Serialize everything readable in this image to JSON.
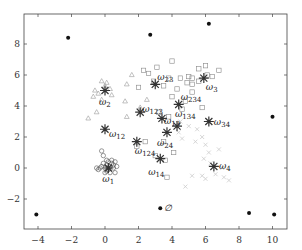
{
  "chart_data": {
    "type": "scatter",
    "title": "",
    "xlabel": "",
    "ylabel": "",
    "xlim": [
      -4.8,
      11
    ],
    "ylim": [
      -3.9,
      9.9
    ],
    "grid": false,
    "legend": null,
    "x_ticks": [
      -4,
      -2,
      0,
      2,
      4,
      6,
      8,
      10
    ],
    "y_ticks": [
      -2,
      0,
      2,
      4,
      6,
      8
    ],
    "x_tick_labels": [
      "-4",
      "-2",
      "0",
      "2",
      "4",
      "6",
      "8",
      "10"
    ],
    "y_tick_labels": [
      "-2",
      "0",
      "2",
      "4",
      "6",
      "8"
    ],
    "series": [
      {
        "name": "outliers",
        "marker": "filled-dot",
        "color": "#111111",
        "points": [
          [
            -4.1,
            -3.0
          ],
          [
            -2.2,
            8.4
          ],
          [
            2.7,
            8.6
          ],
          [
            6.2,
            9.3
          ],
          [
            10.0,
            3.3
          ],
          [
            3.3,
            -2.6
          ],
          [
            8.6,
            -2.9
          ],
          [
            10.1,
            -3.0
          ]
        ]
      },
      {
        "name": "cluster-1-circles",
        "marker": "circle",
        "color": "#555555",
        "points": [
          [
            -0.3,
            0.0
          ],
          [
            -0.5,
            0.0
          ],
          [
            -0.2,
            0.1
          ],
          [
            0.0,
            0.0
          ],
          [
            0.1,
            0.2
          ],
          [
            0.2,
            0.0
          ],
          [
            0.3,
            0.1
          ],
          [
            0.4,
            0.3
          ],
          [
            0.5,
            0.0
          ],
          [
            0.6,
            0.4
          ],
          [
            -0.1,
            0.3
          ],
          [
            0.1,
            -0.2
          ],
          [
            0.2,
            0.4
          ],
          [
            0.3,
            -0.3
          ],
          [
            0.6,
            -0.3
          ],
          [
            0.7,
            0.1
          ],
          [
            -0.2,
            1.1
          ],
          [
            -0.1,
            0.8
          ],
          [
            0.4,
            0.5
          ],
          [
            0.2,
            -0.1
          ],
          [
            0.0,
            -0.3
          ],
          [
            -0.4,
            -0.1
          ],
          [
            0.5,
            0.2
          ],
          [
            0.1,
            0.5
          ]
        ]
      },
      {
        "name": "cluster-2-triangles",
        "marker": "triangle",
        "color": "#999999",
        "points": [
          [
            -0.6,
            5.0
          ],
          [
            -0.4,
            4.8
          ],
          [
            0.0,
            5.3
          ],
          [
            0.3,
            5.1
          ],
          [
            -0.2,
            4.4
          ],
          [
            1.3,
            5.4
          ],
          [
            1.6,
            6.0
          ],
          [
            1.2,
            4.3
          ],
          [
            -0.5,
            3.6
          ],
          [
            -1.0,
            3.2
          ],
          [
            1.3,
            3.3
          ],
          [
            -0.2,
            5.6
          ],
          [
            0.4,
            4.7
          ],
          [
            -0.7,
            4.6
          ],
          [
            2.5,
            4.4
          ],
          [
            2.1,
            3.9
          ],
          [
            0.1,
            5.5
          ]
        ]
      },
      {
        "name": "cluster-3-squares",
        "marker": "square",
        "color": "#888888",
        "points": [
          [
            2.3,
            6.3
          ],
          [
            2.6,
            6.1
          ],
          [
            3.1,
            6.5
          ],
          [
            4.0,
            6.9
          ],
          [
            2.9,
            5.6
          ],
          [
            3.5,
            5.3
          ],
          [
            4.3,
            5.1
          ],
          [
            4.5,
            5.8
          ],
          [
            5.0,
            5.9
          ],
          [
            4.9,
            5.5
          ],
          [
            5.2,
            5.4
          ],
          [
            5.6,
            6.4
          ],
          [
            6.0,
            6.6
          ],
          [
            6.1,
            6.0
          ],
          [
            6.4,
            5.9
          ],
          [
            6.8,
            6.3
          ],
          [
            5.2,
            5.8
          ],
          [
            5.6,
            5.6
          ],
          [
            4.0,
            4.6
          ],
          [
            4.8,
            4.3
          ],
          [
            5.2,
            4.9
          ],
          [
            4.6,
            3.8
          ],
          [
            5.8,
            3.9
          ],
          [
            2.0,
            5.2
          ],
          [
            3.8,
            3.3
          ],
          [
            4.1,
            1.0
          ],
          [
            3.0,
            0.8
          ],
          [
            3.6,
            0.5
          ],
          [
            3.7,
            -0.6
          ],
          [
            3.5,
            1.7
          ],
          [
            3.2,
            3.6
          ],
          [
            2.4,
            1.7
          ],
          [
            1.9,
            1.4
          ],
          [
            3.8,
            5.8
          ]
        ]
      },
      {
        "name": "cluster-4-light-x",
        "marker": "cross",
        "color": "#cccccc",
        "points": [
          [
            4.5,
            3.0
          ],
          [
            5.0,
            2.7
          ],
          [
            5.5,
            2.5
          ],
          [
            5.8,
            2.0
          ],
          [
            6.0,
            1.5
          ],
          [
            6.2,
            1.0
          ],
          [
            5.9,
            0.6
          ],
          [
            6.3,
            0.3
          ],
          [
            7.0,
            0.0
          ],
          [
            5.2,
            -0.5
          ],
          [
            5.8,
            -0.5
          ],
          [
            6.0,
            -0.7
          ],
          [
            7.4,
            -0.8
          ],
          [
            4.8,
            -1.2
          ],
          [
            6.8,
            1.2
          ],
          [
            4.6,
            1.9
          ],
          [
            5.4,
            1.7
          ],
          [
            6.6,
            -0.4
          ],
          [
            4.4,
            2.3
          ],
          [
            7.1,
            -0.6
          ]
        ]
      },
      {
        "name": "cluster-centers",
        "marker": "asterisk",
        "color": "#333333",
        "points": [
          {
            "x": 0.0,
            "y": 5.0,
            "label": "ω",
            "sub": "2",
            "label_dx": -6,
            "label_dy": 14
          },
          {
            "x": 0.0,
            "y": 2.5,
            "label": "ω",
            "sub": "12",
            "label_dx": 4,
            "label_dy": 8
          },
          {
            "x": 0.2,
            "y": 0.0,
            "label": "ω",
            "sub": "1",
            "label_dx": -6,
            "label_dy": 14
          },
          {
            "x": 3.0,
            "y": 5.4,
            "label": "ω",
            "sub": "23",
            "label_dx": 2,
            "label_dy": -4
          },
          {
            "x": 5.9,
            "y": 5.8,
            "label": "ω",
            "sub": "3",
            "label_dx": 2,
            "label_dy": 12
          },
          {
            "x": 2.1,
            "y": 3.6,
            "label": "ω",
            "sub": "123",
            "label_dx": 2,
            "label_dy": 0
          },
          {
            "x": 3.4,
            "y": 3.2,
            "label": "ω",
            "sub": "13",
            "label_dx": 2,
            "label_dy": 6
          },
          {
            "x": 4.4,
            "y": 4.1,
            "label": "ω",
            "sub": "234",
            "label_dx": 2,
            "label_dy": -4
          },
          {
            "x": 6.2,
            "y": 3.0,
            "label": "ω",
            "sub": "34",
            "label_dx": 5,
            "label_dy": 3
          },
          {
            "x": 4.3,
            "y": 2.7,
            "label": "ω",
            "sub": "134",
            "label_dx": -2,
            "label_dy": -9
          },
          {
            "x": 3.7,
            "y": 2.3,
            "label": "ω",
            "sub": "24",
            "label_dx": -10,
            "label_dy": 14
          },
          {
            "x": 1.9,
            "y": 1.7,
            "label": "ω",
            "sub": "124",
            "label_dx": -2,
            "label_dy": 12
          },
          {
            "x": 3.3,
            "y": 0.6,
            "label": "ω",
            "sub": "14",
            "label_dx": -12,
            "label_dy": 16
          },
          {
            "x": 6.5,
            "y": 0.1,
            "label": "ω",
            "sub": "4",
            "label_dx": 5,
            "label_dy": 3
          }
        ]
      }
    ],
    "annotations": [
      {
        "text": "∅",
        "x": 3.55,
        "y": -2.6
      }
    ]
  }
}
